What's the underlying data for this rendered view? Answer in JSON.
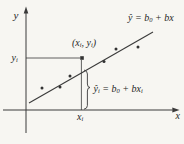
{
  "figure": {
    "description_name": "least-squares-regression-diagram",
    "colors": {
      "ink": "#333333",
      "text": "#262626",
      "background": "#f7f6f2"
    },
    "axis_labels": {
      "y": "y",
      "x": "x"
    },
    "y_i_label": {
      "base": "y",
      "sub": "i"
    },
    "x_i_label": {
      "base": "x",
      "sub": "i"
    },
    "point_label": {
      "open": "(x",
      "sub1": "i",
      "mid": ", y",
      "sub2": "i",
      "close": ")"
    },
    "line_equation": {
      "yhat": "ŷ",
      "eq": " = b",
      "sub0": "0",
      "rest": " + bx"
    },
    "fitted_equation": {
      "yhat": "ŷ",
      "subi": "i",
      "eq": " = b",
      "sub0": "0",
      "rest": " + bx",
      "subi2": "i"
    },
    "regression_line": {
      "x1": 29,
      "y1": 103,
      "x2": 153,
      "y2": 32
    },
    "highlight_point": [
      82,
      58
    ],
    "scatter_points": [
      [
        42,
        88
      ],
      [
        60,
        87
      ],
      [
        70,
        76
      ],
      [
        104,
        61.5
      ],
      [
        116,
        49
      ],
      [
        138,
        47
      ]
    ]
  }
}
